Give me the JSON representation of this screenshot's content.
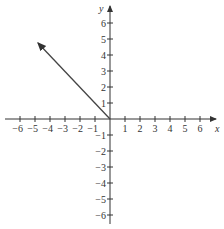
{
  "graph": {
    "x_axis_label": "x",
    "y_axis_label": "y",
    "x_ticks": [
      -6,
      -5,
      -4,
      -3,
      -2,
      -1,
      1,
      2,
      3,
      4,
      5,
      6
    ],
    "y_ticks": [
      6,
      5,
      4,
      3,
      2,
      1,
      -1,
      -2,
      -3,
      -4,
      -5,
      -6
    ],
    "ray": {
      "from": [
        0,
        0
      ],
      "toward": [
        -5,
        5
      ],
      "description": "ray from origin through (-5,5)"
    },
    "axis_color": "#333333",
    "ray_color": "#444444"
  }
}
